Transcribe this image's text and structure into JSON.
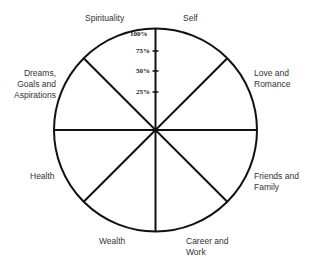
{
  "diagram": {
    "type": "wheel-of-life",
    "segments": [
      "Self",
      "Love and Romance",
      "Friends and Family",
      "Career and Work",
      "Wealth",
      "Health",
      "Dreams, Goals and Aspirations",
      "Spirituality"
    ],
    "scale_ticks": [
      "100%",
      "75%",
      "50%",
      "25%"
    ]
  },
  "labels": {
    "self": "Self",
    "love": [
      "Love and",
      "Romance"
    ],
    "friends": [
      "Friends and",
      "Family"
    ],
    "career": [
      "Career and",
      "Work"
    ],
    "wealth": "Wealth",
    "health": "Health",
    "dreams": [
      "Dreams,",
      "Goals and",
      "Aspirations"
    ],
    "spirituality": "Spirituality"
  },
  "ticks": {
    "t100": "100%",
    "t75": "75%",
    "t50": "50%",
    "t25": "25%"
  }
}
